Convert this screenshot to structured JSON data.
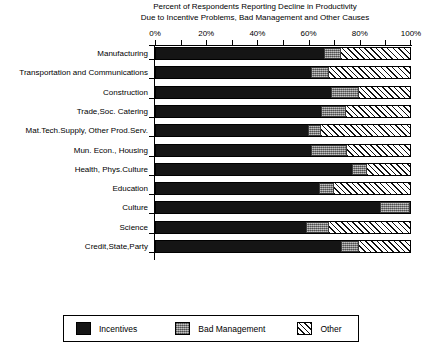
{
  "title": {
    "line1": "Percent of Respondents Reporting Decline in Productivity",
    "line2": "Due to Incentive Problems, Bad Management and Other Causes"
  },
  "legend": {
    "items": [
      {
        "label": "Incentives",
        "color": "#151515",
        "pattern": "solid-black"
      },
      {
        "label": "Bad Management",
        "color": "#8e8e8e",
        "pattern": "stippled-gray"
      },
      {
        "label": "Other",
        "color": "#ffffff",
        "pattern": "diagonal-hatch"
      }
    ]
  },
  "chart_data": {
    "type": "bar",
    "orientation": "horizontal",
    "stacked": true,
    "title": "Percent of Respondents Reporting Decline in Productivity Due to Incentive Problems, Bad Management and Other Causes",
    "xlabel": "",
    "ylabel": "",
    "xlim": [
      0,
      100
    ],
    "xticks": [
      0,
      10,
      20,
      30,
      40,
      50,
      60,
      70,
      80,
      90,
      100
    ],
    "xtick_labels": [
      "0%",
      "20%",
      "40%",
      "60%",
      "80%",
      "100%"
    ],
    "xtick_label_values": [
      0,
      20,
      40,
      60,
      80,
      100
    ],
    "grid": false,
    "axis_position": "top",
    "legend_position": "bottom",
    "categories": [
      "Manufacturing",
      "Transportation and Communications",
      "Construction",
      "Trade,Soc. Catering",
      "Mat.Tech.Supply, Other Prod.Serv.",
      "Mun. Econ., Housing",
      "Health, Phys.Culture",
      "Education",
      "Culture",
      "Science",
      "Credit,State,Party"
    ],
    "series": [
      {
        "name": "Incentives",
        "values": [
          66,
          61,
          69,
          65,
          60,
          61,
          77,
          64,
          88,
          59,
          73
        ]
      },
      {
        "name": "Bad Management",
        "values": [
          7,
          7,
          11,
          10,
          5,
          14,
          6,
          6,
          12,
          9,
          7
        ]
      },
      {
        "name": "Other",
        "values": [
          27,
          32,
          20,
          25,
          35,
          25,
          17,
          30,
          0,
          32,
          20
        ]
      }
    ]
  }
}
